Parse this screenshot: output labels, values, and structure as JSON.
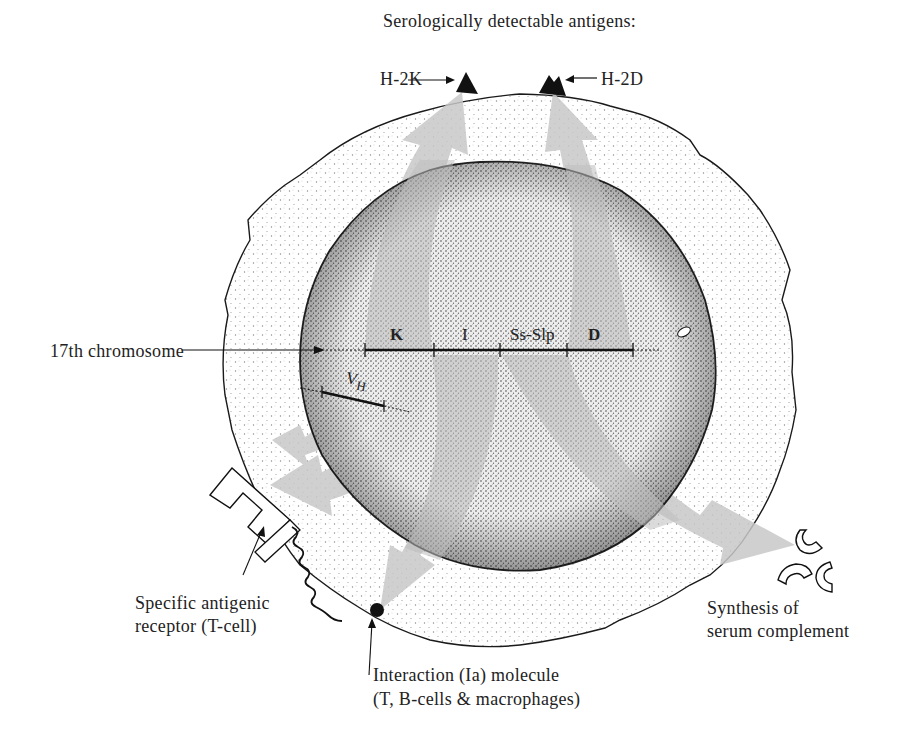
{
  "title": "Serologically detectable antigens:",
  "antigens": {
    "h2k": "H-2K",
    "h2d": "H-2D"
  },
  "chromosome": {
    "label": "17th chromosome",
    "regions": [
      "K",
      "I",
      "Ss-Slp",
      "D"
    ]
  },
  "vh_label": "V",
  "vh_sub": "H",
  "labels": {
    "receptor_line1": "Specific antigenic",
    "receptor_line2": "receptor (T-cell)",
    "interaction_line1": "Interaction (Ia) molecule",
    "interaction_line2": "(T, B-cells & macrophages)",
    "complement_line1": "Synthesis of",
    "complement_line2": "serum complement"
  },
  "colors": {
    "arrow_gray": "#c8c8c8",
    "cytoplasm_dots": "#9a9a9a",
    "nucleus_dots": "#3a3a3a",
    "outline": "#1a1a1a"
  }
}
